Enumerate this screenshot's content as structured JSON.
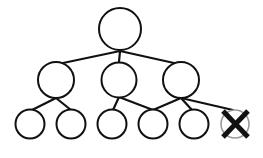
{
  "diagram": {
    "type": "tree",
    "colors": {
      "background": "#ffffff",
      "line": "#111111",
      "removed_node_outline": "#9a9a9a",
      "x_mark": "#111111"
    },
    "nodes": [
      {
        "id": "root",
        "level": 0,
        "cx": 120,
        "cy": 29,
        "r": 21,
        "removed": false
      },
      {
        "id": "m1",
        "level": 1,
        "cx": 56,
        "cy": 80,
        "r": 18,
        "removed": false
      },
      {
        "id": "m2",
        "level": 1,
        "cx": 119,
        "cy": 80,
        "r": 17.5,
        "removed": false
      },
      {
        "id": "m3",
        "level": 1,
        "cx": 181,
        "cy": 80,
        "r": 18,
        "removed": false
      },
      {
        "id": "l1",
        "level": 2,
        "cx": 30,
        "cy": 124,
        "r": 14.5,
        "removed": false
      },
      {
        "id": "l2",
        "level": 2,
        "cx": 71,
        "cy": 124,
        "r": 14.5,
        "removed": false
      },
      {
        "id": "l3",
        "level": 2,
        "cx": 112,
        "cy": 124,
        "r": 14.5,
        "removed": false
      },
      {
        "id": "l4",
        "level": 2,
        "cx": 153,
        "cy": 124,
        "r": 14.5,
        "removed": false
      },
      {
        "id": "l5",
        "level": 2,
        "cx": 194,
        "cy": 124,
        "r": 14.5,
        "removed": false
      },
      {
        "id": "l6",
        "level": 2,
        "cx": 235,
        "cy": 124,
        "r": 14,
        "removed": true
      }
    ],
    "edges": [
      {
        "from": "root",
        "to": "m1",
        "x1": 120,
        "y1": 51,
        "x2": 63,
        "y2": 63
      },
      {
        "from": "root",
        "to": "m2",
        "x1": 120,
        "y1": 51,
        "x2": 119,
        "y2": 62
      },
      {
        "from": "root",
        "to": "m3",
        "x1": 120,
        "y1": 51,
        "x2": 174,
        "y2": 63
      },
      {
        "from": "m1",
        "to": "l1",
        "x1": 56,
        "y1": 98,
        "x2": 32,
        "y2": 110
      },
      {
        "from": "m1",
        "to": "l2",
        "x1": 56,
        "y1": 98,
        "x2": 71,
        "y2": 110
      },
      {
        "from": "m2",
        "to": "l3",
        "x1": 119,
        "y1": 97,
        "x2": 113,
        "y2": 110
      },
      {
        "from": "m2",
        "to": "l4",
        "x1": 119,
        "y1": 97,
        "x2": 153,
        "y2": 110
      },
      {
        "from": "m3",
        "to": "l4",
        "x1": 181,
        "y1": 98,
        "x2": 153,
        "y2": 110
      },
      {
        "from": "m3",
        "to": "l5",
        "x1": 181,
        "y1": 98,
        "x2": 192,
        "y2": 110
      },
      {
        "from": "m3",
        "to": "l6",
        "x1": 181,
        "y1": 98,
        "x2": 233,
        "y2": 110
      }
    ],
    "x_mark": {
      "node": "l6",
      "lines": [
        [
          223,
          111,
          248,
          137
        ],
        [
          248,
          111,
          223,
          137
        ]
      ]
    }
  }
}
